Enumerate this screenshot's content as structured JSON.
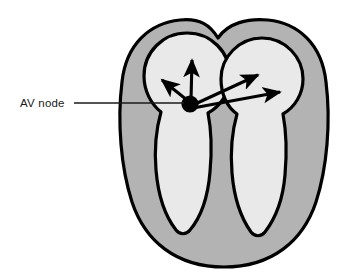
{
  "figure": {
    "kind": "anatomical-diagram",
    "background_color": "#ffffff"
  },
  "colors": {
    "myocardium": "#b3b3b3",
    "chamber": "#e9e9e9",
    "outline": "#000000",
    "arrow": "#000000",
    "node": "#000000",
    "label_text": "#1a1a1a",
    "leader_line": "#1a1a1a"
  },
  "annotations": [
    {
      "id": "av-node",
      "label": "AV node",
      "label_x": 20,
      "label_y": 107,
      "leader_from_x": 74,
      "leader_from_y": 103,
      "leader_to_x": 184,
      "leader_to_y": 103
    }
  ],
  "structures": {
    "heart_outline": {
      "name": "heart-outline",
      "left": 122,
      "top": 22,
      "right": 327,
      "bottom": 267,
      "fill": "#b3b3b3"
    },
    "left_atrium": {
      "name": "left-atrium",
      "center_x": 187,
      "center_y": 76,
      "radius": 43,
      "fill": "#e9e9e9"
    },
    "right_atrium": {
      "name": "right-atrium",
      "center_x": 262,
      "center_y": 79,
      "radius": 41,
      "fill": "#e9e9e9"
    },
    "left_ventricle": {
      "name": "left-ventricle",
      "fill": "#e9e9e9"
    },
    "right_ventricle": {
      "name": "right-ventricle",
      "fill": "#e9e9e9"
    },
    "av_node": {
      "name": "av-node-marker",
      "center_x": 190,
      "center_y": 104,
      "radius": 8.5,
      "fill": "#000000"
    }
  },
  "conduction_arrows": [
    {
      "id": "arrow-up",
      "name": "conduction-arrow-up",
      "x1": 191,
      "y1": 100,
      "x2": 192,
      "y2": 57
    },
    {
      "id": "arrow-up-left",
      "name": "conduction-arrow-up-left",
      "x1": 187,
      "y1": 100,
      "x2": 159,
      "y2": 77
    },
    {
      "id": "arrow-up-right",
      "name": "conduction-arrow-up-right",
      "x1": 193,
      "y1": 105,
      "x2": 261,
      "y2": 73
    },
    {
      "id": "arrow-right",
      "name": "conduction-arrow-right",
      "x1": 193,
      "y1": 108,
      "x2": 284,
      "y2": 91
    }
  ]
}
